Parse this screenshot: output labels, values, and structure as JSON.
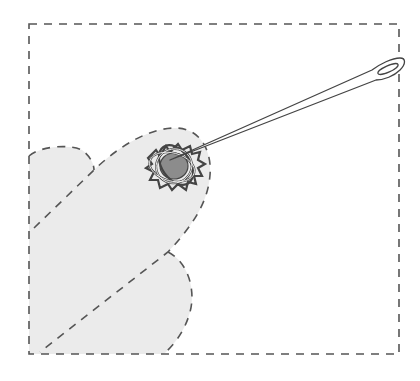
{
  "figure": {
    "elements": [
      {
        "name": "fabric-square",
        "description": "dashed square outline representing the fabric area"
      },
      {
        "name": "folded-fabric-left-lobe",
        "description": "light gray shaded lobe at left edge"
      },
      {
        "name": "folded-fabric-lower-lobe",
        "description": "light gray shaded lobe at bottom"
      },
      {
        "name": "folded-fabric-diagonal-flap",
        "description": "elongated shaded flap with dashed outline"
      },
      {
        "name": "knot",
        "description": "woven thread knot around a gray center"
      },
      {
        "name": "needle",
        "description": "long needle with an eye, diagonally pointing to the top-right"
      }
    ]
  },
  "colors": {
    "background": "#ffffff",
    "fabric_fill": "#ebebeb",
    "dash_stroke": "#555555",
    "knot_center": "#8c8c8c",
    "outline": "#444444",
    "needle_fill": "#ffffff"
  }
}
